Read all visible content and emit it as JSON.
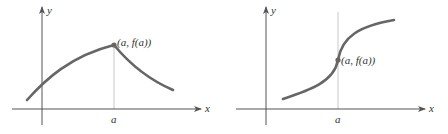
{
  "figure": {
    "panels": [
      {
        "id": "left",
        "description": "Graph with a corner (sharp peak) at x = a",
        "x_axis_label": "x",
        "y_axis_label": "y",
        "tick_label": "a",
        "point_label": "(a, f(a))",
        "curve_shape": "corner"
      },
      {
        "id": "right",
        "description": "Graph with a vertical tangent at x = a",
        "x_axis_label": "x",
        "y_axis_label": "y",
        "tick_label": "a",
        "point_label": "(a, f(a))",
        "curve_shape": "vertical-tangent"
      }
    ],
    "colors": {
      "curve": "#666666",
      "axis": "#555555",
      "guide_line": "#c8c8c8",
      "point": "#666666",
      "text": "#333333"
    }
  }
}
